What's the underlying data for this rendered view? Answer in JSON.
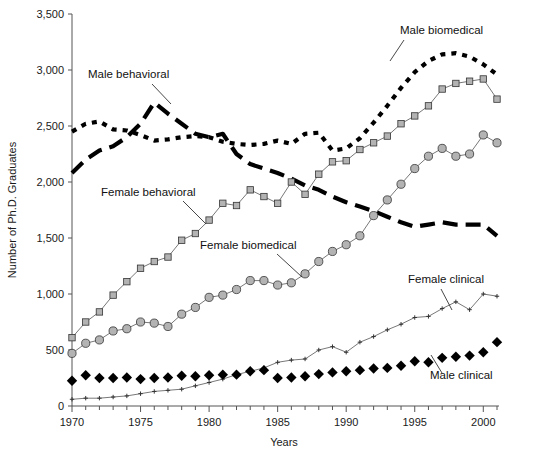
{
  "chart_data": {
    "type": "line",
    "title": "",
    "xlabel": "Years",
    "ylabel": "Number of Ph.D. Graduates",
    "xlim": [
      1969.5,
      2001.5
    ],
    "ylim": [
      0,
      3500
    ],
    "ytick_labels": [
      "0",
      "500",
      "1,000",
      "1,500",
      "2,000",
      "2,500",
      "3,000",
      "3,500"
    ],
    "ytick_values": [
      0,
      500,
      1000,
      1500,
      2000,
      2500,
      3000,
      3500
    ],
    "xtick_labels": [
      "1970",
      "1975",
      "1980",
      "1985",
      "1990",
      "1995",
      "2000"
    ],
    "xtick_values": [
      1970,
      1975,
      1980,
      1985,
      1990,
      1995,
      2000
    ],
    "xtick_minor_step": 1,
    "grid": false,
    "legend_position": "inline-annotations",
    "x": [
      1970,
      1971,
      1972,
      1973,
      1974,
      1975,
      1976,
      1977,
      1978,
      1979,
      1980,
      1981,
      1982,
      1983,
      1984,
      1985,
      1986,
      1987,
      1988,
      1989,
      1990,
      1991,
      1992,
      1993,
      1994,
      1995,
      1996,
      1997,
      1998,
      1999,
      2000,
      2001
    ],
    "series": [
      {
        "name": "Male biomedical",
        "style": "dotted-thick-black",
        "color": "#000000",
        "marker": "none",
        "values": [
          2450,
          2520,
          2540,
          2470,
          2460,
          2420,
          2370,
          2380,
          2400,
          2410,
          2400,
          2360,
          2340,
          2330,
          2340,
          2370,
          2340,
          2430,
          2440,
          2280,
          2300,
          2390,
          2530,
          2680,
          2840,
          2980,
          3080,
          3140,
          3150,
          3120,
          3050,
          2960
        ]
      },
      {
        "name": "Male behavioral",
        "style": "dashed-thick-black",
        "color": "#000000",
        "marker": "none",
        "values": [
          2080,
          2200,
          2280,
          2320,
          2400,
          2520,
          2710,
          2610,
          2520,
          2430,
          2400,
          2430,
          2250,
          2160,
          2120,
          2080,
          2030,
          1970,
          1930,
          1870,
          1820,
          1780,
          1740,
          1690,
          1640,
          1600,
          1620,
          1640,
          1620,
          1620,
          1620,
          1520
        ]
      },
      {
        "name": "Female behavioral",
        "style": "thin-line",
        "color": "#555555",
        "marker": "square-gray",
        "values": [
          610,
          750,
          840,
          990,
          1110,
          1230,
          1290,
          1330,
          1480,
          1540,
          1660,
          1810,
          1790,
          1930,
          1870,
          1810,
          2000,
          1890,
          2070,
          2180,
          2190,
          2290,
          2350,
          2410,
          2520,
          2590,
          2680,
          2830,
          2880,
          2900,
          2920,
          2740
        ]
      },
      {
        "name": "Female biomedical",
        "style": "thin-line",
        "color": "#555555",
        "marker": "circle-gray",
        "values": [
          470,
          560,
          590,
          670,
          690,
          750,
          740,
          710,
          820,
          880,
          970,
          990,
          1040,
          1120,
          1120,
          1080,
          1100,
          1180,
          1290,
          1380,
          1440,
          1520,
          1700,
          1840,
          1980,
          2120,
          2230,
          2300,
          2230,
          2250,
          2420,
          2350
        ]
      },
      {
        "name": "Female clinical",
        "style": "thin-line",
        "color": "#555555",
        "marker": "cross-small",
        "values": [
          60,
          70,
          70,
          80,
          90,
          110,
          130,
          140,
          150,
          180,
          210,
          240,
          280,
          310,
          340,
          390,
          410,
          420,
          500,
          530,
          480,
          570,
          620,
          680,
          730,
          790,
          800,
          870,
          930,
          860,
          1000,
          980
        ]
      },
      {
        "name": "Male clinical",
        "style": "markers-only",
        "color": "#000000",
        "marker": "diamond-black",
        "values": [
          225,
          275,
          250,
          250,
          255,
          240,
          250,
          255,
          270,
          265,
          275,
          280,
          280,
          310,
          320,
          250,
          255,
          265,
          285,
          300,
          310,
          320,
          335,
          340,
          360,
          400,
          390,
          430,
          440,
          450,
          480,
          570
        ]
      }
    ],
    "annotations": [
      {
        "text": "Male behavioral",
        "x": 88,
        "y": 78,
        "leader": {
          "x1": 152,
          "y1": 84,
          "x2": 171,
          "y2": 104
        }
      },
      {
        "text": "Male biomedical",
        "x": 400,
        "y": 34,
        "leader": {
          "x1": 404,
          "y1": 40,
          "x2": 390,
          "y2": 61
        }
      },
      {
        "text": "Female behavioral",
        "x": 101,
        "y": 196,
        "leader": {
          "x1": 183,
          "y1": 201,
          "x2": 206,
          "y2": 224
        }
      },
      {
        "text": "Female biomedical",
        "x": 200,
        "y": 249,
        "leader": {
          "x1": 277,
          "y1": 254,
          "x2": 302,
          "y2": 277
        }
      },
      {
        "text": "Female clinical",
        "x": 408,
        "y": 283,
        "leader": {
          "x1": 441,
          "y1": 289,
          "x2": 452,
          "y2": 310
        }
      },
      {
        "text": "Male clinical",
        "x": 430,
        "y": 379,
        "leader": {
          "x1": 442,
          "y1": 373,
          "x2": 431,
          "y2": 355
        }
      }
    ]
  },
  "figure": {
    "plot_left_px": 72,
    "plot_right_px": 497,
    "plot_top_px": 14,
    "plot_bottom_px": 406
  }
}
